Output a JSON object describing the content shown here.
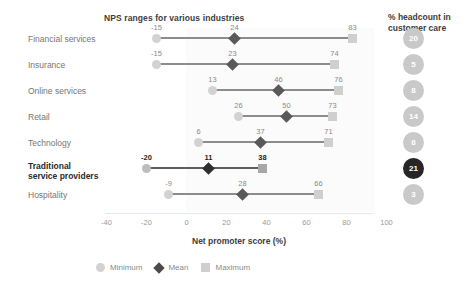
{
  "chart_data": {
    "type": "line",
    "title": "NPS ranges for various industries",
    "xlabel": "Net promoter score (%)",
    "ylabel": "",
    "xlim": [
      -40,
      100
    ],
    "xticks": [
      "-40",
      "-20",
      "0",
      "20",
      "40",
      "60",
      "80",
      "100"
    ],
    "xtick_values": [
      -40,
      -20,
      0,
      20,
      40,
      60,
      80,
      100
    ],
    "grid": false,
    "legend_position": "bottom",
    "categories": [
      "Financial services",
      "Insurance",
      "Online services",
      "Retail",
      "Technology",
      "Traditional service providers",
      "Hospitality"
    ],
    "series": [
      {
        "name": "Minimum",
        "values": [
          -15,
          -15,
          13,
          26,
          6,
          -20,
          -9
        ]
      },
      {
        "name": "Mean",
        "values": [
          24,
          23,
          46,
          50,
          37,
          11,
          28
        ]
      },
      {
        "name": "Maximum",
        "values": [
          83,
          74,
          76,
          73,
          71,
          38,
          66
        ]
      }
    ],
    "rows": [
      {
        "label": "Financial services",
        "label_lines": [
          "Financial services"
        ],
        "min": -15,
        "mean": 24,
        "max": 83,
        "min_text": "-15",
        "mean_text": "24",
        "max_text": "83",
        "headcount": "20",
        "highlight": false
      },
      {
        "label": "Insurance",
        "label_lines": [
          "Insurance"
        ],
        "min": -15,
        "mean": 23,
        "max": 74,
        "min_text": "-15",
        "mean_text": "23",
        "max_text": "74",
        "headcount": "5",
        "highlight": false
      },
      {
        "label": "Online services",
        "label_lines": [
          "Online services"
        ],
        "min": 13,
        "mean": 46,
        "max": 76,
        "min_text": "13",
        "mean_text": "46",
        "max_text": "76",
        "headcount": "8",
        "highlight": false
      },
      {
        "label": "Retail",
        "label_lines": [
          "Retail"
        ],
        "min": 26,
        "mean": 50,
        "max": 73,
        "min_text": "26",
        "mean_text": "50",
        "max_text": "73",
        "headcount": "14",
        "highlight": false
      },
      {
        "label": "Technology",
        "label_lines": [
          "Technology"
        ],
        "min": 6,
        "mean": 37,
        "max": 71,
        "min_text": "6",
        "mean_text": "37",
        "max_text": "71",
        "headcount": "8",
        "highlight": false
      },
      {
        "label": "Traditional service providers",
        "label_lines": [
          "Traditional",
          "service providers"
        ],
        "min": -20,
        "mean": 11,
        "max": 38,
        "min_text": "-20",
        "mean_text": "11",
        "max_text": "38",
        "headcount": "21",
        "highlight": true
      },
      {
        "label": "Hospitality",
        "label_lines": [
          "Hospitality"
        ],
        "min": -9,
        "mean": 28,
        "max": 66,
        "min_text": "-9",
        "mean_text": "28",
        "max_text": "66",
        "headcount": "3",
        "highlight": false
      }
    ],
    "legend": [
      {
        "label": "Minimum",
        "marker": "circle",
        "color": "#d2d2d2"
      },
      {
        "label": "Mean",
        "marker": "diamond",
        "color": "#4a4a4a"
      },
      {
        "label": "Maximum",
        "marker": "square",
        "color": "#cfcfcf"
      }
    ]
  },
  "headcount_panel": {
    "title": "% headcount in customer care",
    "title_line1": "% headcount in",
    "title_line2": "customer care",
    "values": [
      "20",
      "5",
      "8",
      "14",
      "8",
      "21",
      "3"
    ]
  },
  "colors": {
    "min_marker": "#d2d2d2",
    "mean_marker": "#595959",
    "max_marker": "#cfcfcf",
    "line": "#8c8c8c",
    "highlight_badge": "#262626",
    "badge": "#c9c9c9",
    "plot_band": "#fbfbfb"
  }
}
